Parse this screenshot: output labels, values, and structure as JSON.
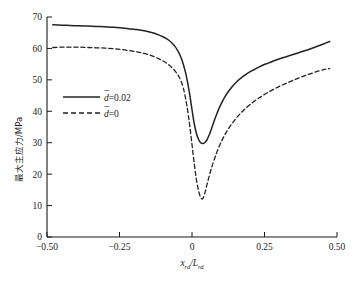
{
  "chart_data": {
    "type": "line",
    "title": "",
    "xlabel": "x_rd / L_rd",
    "ylabel": "最大主应力/MPa",
    "xlim": [
      -0.5,
      0.5
    ],
    "ylim": [
      0,
      70
    ],
    "xticks": [
      -0.5,
      -0.25,
      0,
      0.25,
      0.5
    ],
    "xticklabels": [
      "−0.50",
      "−0.25",
      "0",
      "0.25",
      "0.50"
    ],
    "yticks": [
      0,
      10,
      20,
      30,
      40,
      50,
      60,
      70
    ],
    "yticklabels": [
      "0",
      "10",
      "20",
      "30",
      "40",
      "50",
      "60",
      "70"
    ],
    "grid": false,
    "legend_position": "center-left",
    "series": [
      {
        "name": "d̄=0.02",
        "style": "solid",
        "color": "#222222",
        "x": [
          -0.48,
          -0.45,
          -0.42,
          -0.39,
          -0.36,
          -0.33,
          -0.3,
          -0.27,
          -0.24,
          -0.21,
          -0.19,
          -0.17,
          -0.15,
          -0.13,
          -0.115,
          -0.1,
          -0.09,
          -0.08,
          -0.07,
          -0.06,
          -0.05,
          -0.042,
          -0.035,
          -0.028,
          -0.022,
          -0.016,
          -0.01,
          -0.005,
          0.0,
          0.005,
          0.01,
          0.016,
          0.022,
          0.028,
          0.034,
          0.04,
          0.046,
          0.052,
          0.058,
          0.064,
          0.07,
          0.078,
          0.086,
          0.094,
          0.104,
          0.115,
          0.128,
          0.142,
          0.158,
          0.175,
          0.195,
          0.215,
          0.24,
          0.265,
          0.29,
          0.315,
          0.34,
          0.37,
          0.4,
          0.43,
          0.455,
          0.475
        ],
        "y": [
          67.5,
          67.4,
          67.3,
          67.2,
          67.1,
          67.0,
          66.9,
          66.7,
          66.5,
          66.2,
          66.0,
          65.7,
          65.3,
          64.8,
          64.3,
          63.7,
          63.2,
          62.6,
          61.8,
          60.8,
          59.4,
          58.0,
          56.4,
          54.3,
          52.2,
          49.6,
          46.5,
          43.6,
          40.5,
          37.5,
          35.0,
          32.7,
          31.2,
          30.2,
          29.8,
          29.8,
          30.2,
          31.0,
          32.2,
          33.6,
          35.2,
          37.3,
          39.3,
          41.1,
          43.0,
          44.8,
          46.6,
          48.2,
          49.7,
          51.0,
          52.3,
          53.3,
          54.5,
          55.4,
          56.3,
          57.1,
          57.8,
          58.7,
          59.6,
          60.6,
          61.5,
          62.2
        ]
      },
      {
        "name": "d̄=0",
        "style": "dashed",
        "color": "#222222",
        "x": [
          -0.48,
          -0.45,
          -0.42,
          -0.39,
          -0.36,
          -0.33,
          -0.3,
          -0.27,
          -0.24,
          -0.21,
          -0.185,
          -0.165,
          -0.145,
          -0.128,
          -0.112,
          -0.098,
          -0.086,
          -0.074,
          -0.064,
          -0.054,
          -0.045,
          -0.037,
          -0.03,
          -0.024,
          -0.018,
          -0.012,
          -0.007,
          -0.002,
          0.003,
          0.008,
          0.012,
          0.016,
          0.02,
          0.024,
          0.028,
          0.032,
          0.036,
          0.04,
          0.046,
          0.052,
          0.06,
          0.068,
          0.078,
          0.09,
          0.104,
          0.12,
          0.138,
          0.158,
          0.18,
          0.205,
          0.232,
          0.26,
          0.29,
          0.32,
          0.35,
          0.38,
          0.41,
          0.44,
          0.462,
          0.475
        ],
        "y": [
          60.3,
          60.4,
          60.4,
          60.4,
          60.3,
          60.2,
          60.1,
          59.9,
          59.6,
          59.2,
          58.8,
          58.4,
          57.9,
          57.3,
          56.6,
          55.9,
          55.2,
          54.3,
          53.4,
          52.3,
          51.0,
          49.4,
          47.4,
          45.0,
          42.0,
          38.4,
          34.8,
          31.0,
          27.0,
          23.2,
          20.3,
          17.8,
          15.8,
          14.2,
          13.0,
          12.3,
          12.1,
          12.7,
          14.5,
          16.8,
          19.6,
          22.2,
          25.0,
          28.0,
          30.9,
          33.6,
          36.1,
          38.4,
          40.5,
          42.5,
          44.3,
          45.9,
          47.4,
          48.7,
          49.9,
          51.0,
          52.0,
          52.9,
          53.4,
          53.6
        ]
      }
    ]
  },
  "axis": {
    "ylabel_cjk": "最大主应力/MPa",
    "xlabel_main": "x",
    "xlabel_sub1": "rd",
    "xlabel_slash": "/L",
    "xlabel_sub2": "rd"
  },
  "legend": {
    "items": [
      {
        "label_var": "d",
        "label_rest": "=0.02",
        "style": "solid"
      },
      {
        "label_var": "d",
        "label_rest": "=0",
        "style": "dashed"
      }
    ]
  },
  "caption": {
    "text": ""
  }
}
